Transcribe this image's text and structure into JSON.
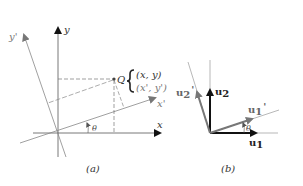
{
  "figure_a": {
    "caption": "(a)",
    "axes": {
      "x_label": "x",
      "y_label": "y",
      "x_prime_label": "x'",
      "y_prime_label": "y'"
    },
    "point": {
      "name": "Q",
      "coords_original": "(x, y)",
      "coords_rotated": "(x', y')"
    },
    "angle_label": "θ"
  },
  "figure_b": {
    "caption": "(b)",
    "vectors": {
      "u1": "u",
      "u1_sub": "1",
      "u2": "u",
      "u2_sub": "2",
      "u1_prime": "u",
      "u1_prime_sub": "1",
      "u1_prime_mark": "'",
      "u2_prime": "u",
      "u2_prime_sub": "2",
      "u2_prime_mark": "'"
    },
    "angle_label": "θ"
  },
  "colors": {
    "axis": "#222222",
    "rotated": "#777777",
    "thin": "#999999"
  }
}
